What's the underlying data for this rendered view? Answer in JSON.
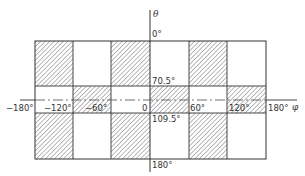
{
  "diagram": {
    "axes": {
      "horizontal_label": "φ",
      "vertical_label": "θ"
    },
    "phi_ticks": [
      "−180°",
      "−120°",
      "−60°",
      "0",
      "60°",
      "120°",
      "180°"
    ],
    "theta_ticks": [
      "0°",
      "70.5°",
      "109.5°",
      "180°"
    ],
    "columns_phi": [
      -180,
      -120,
      -60,
      0,
      60,
      120,
      180
    ],
    "rows_theta": [
      0,
      70.5,
      109.5,
      180
    ],
    "shaded_cells": {
      "top_band_0_to_70.5": [
        "-180..-120",
        "-60..0",
        "60..120"
      ],
      "middle_band_70.5_to_109.5": [
        "-120..-60",
        "0..60",
        "120..180"
      ],
      "bottom_band_109.5_to_180": [
        "-180..-120",
        "-60..0",
        "60..120"
      ]
    },
    "colors": {
      "line": "#333333",
      "hatch": "#555555",
      "background": "#ffffff"
    }
  }
}
